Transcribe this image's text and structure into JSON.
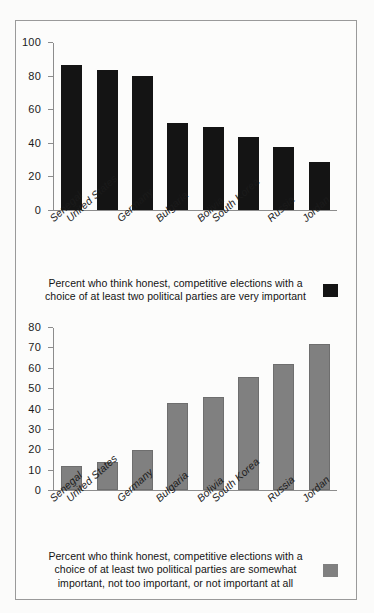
{
  "figure": {
    "background_color": "#fbfbfa",
    "border_color": "#9a9a9a"
  },
  "chart_data": [
    {
      "type": "bar",
      "id": "very-important",
      "title": "",
      "xlabel": "",
      "ylabel": "",
      "ylim": [
        0,
        100
      ],
      "ytick_step": 20,
      "yticks": [
        "100",
        "80",
        "60",
        "40",
        "20",
        "0"
      ],
      "grid": false,
      "bar_color": "#141414",
      "categories": [
        "Senegal",
        "United States",
        "Germany",
        "Bulgaria",
        "Bolivia",
        "South Korea",
        "Russia",
        "Jordan"
      ],
      "values": [
        87,
        84,
        80,
        52,
        50,
        44,
        38,
        29
      ],
      "legend": {
        "position": "below",
        "swatch_color": "#141414",
        "label": "Percent who think honest, competitive elections with a choice of at least two political parties are very important"
      }
    },
    {
      "type": "bar",
      "id": "somewhat-or-less-important",
      "title": "",
      "xlabel": "",
      "ylabel": "",
      "ylim": [
        0,
        80
      ],
      "ytick_step": 10,
      "yticks": [
        "80",
        "70",
        "60",
        "50",
        "40",
        "30",
        "20",
        "10",
        "0"
      ],
      "grid": false,
      "bar_color": "#808080",
      "categories": [
        "Senegal",
        "United States",
        "Germany",
        "Bulgaria",
        "Bolivia",
        "South Korea",
        "Russia",
        "Jordan"
      ],
      "values": [
        12,
        14,
        20,
        43,
        46,
        56,
        62,
        72
      ],
      "legend": {
        "position": "below",
        "swatch_color": "#808080",
        "label": "Percent who think honest, competitive elections with a choice of at least two political parties are somewhat important, not too important, or not important at all"
      }
    }
  ]
}
